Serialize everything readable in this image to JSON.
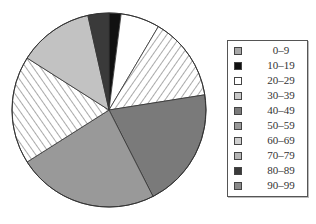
{
  "chart_data": {
    "type": "pie",
    "title": "",
    "start_angle_deg": 0,
    "direction": "clockwise",
    "legend_position": "right",
    "categories": [
      "0–9",
      "10–19",
      "20–29",
      "30–39",
      "40–49",
      "50–59",
      "60–69",
      "70–79",
      "80–89",
      "90–99"
    ],
    "values": [
      0.0,
      2.0,
      6.5,
      14.0,
      20.0,
      23.5,
      18.0,
      12.5,
      3.5,
      0.0
    ],
    "colors": [
      "#a8a8a8",
      "#111111",
      "#ffffff",
      "hatch-down",
      "#7a7a7a",
      "#999999",
      "hatch-up",
      "#c2c2c2",
      "#3a3a3a",
      "#8a8a8a"
    ]
  },
  "legend": {
    "items": [
      {
        "label": "0–9",
        "color": "#a8a8a8"
      },
      {
        "label": "10–19",
        "color": "#111111"
      },
      {
        "label": "20–29",
        "color": "#ffffff"
      },
      {
        "label": "30–39",
        "color": "#c8c8c8"
      },
      {
        "label": "40–49",
        "color": "#7a7a7a"
      },
      {
        "label": "50–59",
        "color": "#999999"
      },
      {
        "label": "60–69",
        "color": "#d0d0d0"
      },
      {
        "label": "70–79",
        "color": "#b5b5b5"
      },
      {
        "label": "80–89",
        "color": "#3a3a3a"
      },
      {
        "label": "90–99",
        "color": "#8a8a8a"
      }
    ]
  }
}
